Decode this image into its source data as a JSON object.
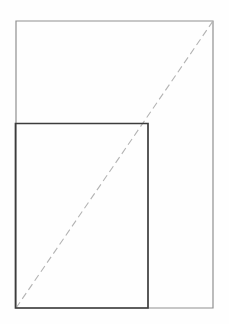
{
  "canvas": {
    "width": 229,
    "height": 324,
    "background_color": "#fefefe"
  },
  "figure": {
    "kind": "geometry-diagram",
    "shapes": [
      {
        "name": "outer-rectangle",
        "type": "rectangle",
        "x": 16,
        "y": 21,
        "width": 197,
        "height": 287,
        "stroke_color": "#8f8f8f",
        "stroke_width": 1.2,
        "fill": "none",
        "dashed": false
      },
      {
        "name": "inner-rectangle",
        "type": "rectangle",
        "x": 15.5,
        "y": 123.5,
        "width": 132.5,
        "height": 184.5,
        "stroke_color": "#3c3c3c",
        "stroke_width": 1.7,
        "fill": "none",
        "dashed": false
      },
      {
        "name": "shared-diagonal",
        "type": "line",
        "x1": 16,
        "y1": 308,
        "x2": 213,
        "y2": 21,
        "stroke_color": "#b3b3b3",
        "stroke_width": 1.1,
        "dashed": true,
        "dash_pattern": "7 4"
      }
    ],
    "vertices": {
      "outer_top_left": [
        16,
        21
      ],
      "outer_top_right": [
        213,
        21
      ],
      "outer_bottom_right": [
        213,
        308
      ],
      "outer_bottom_left": [
        16,
        308
      ],
      "inner_top_left": [
        15,
        123
      ],
      "inner_top_right": [
        148,
        123
      ],
      "inner_bottom_right": [
        148,
        308
      ],
      "inner_bottom_left": [
        15,
        308
      ]
    }
  }
}
